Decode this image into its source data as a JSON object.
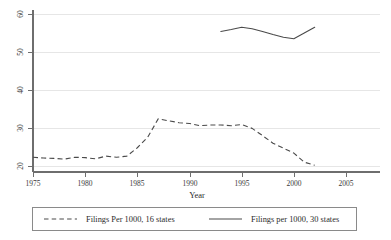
{
  "chart_data": {
    "type": "line",
    "title": "",
    "xlabel": "Year",
    "ylabel": "",
    "xlim": [
      1975,
      2005
    ],
    "ylim": [
      20,
      60
    ],
    "grid": true,
    "legend_position": "bottom",
    "x_ticks": [
      "1975",
      "1980",
      "1985",
      "1990",
      "1995",
      "2000",
      "2005"
    ],
    "x_tick_values": [
      1975,
      1980,
      1985,
      1990,
      1995,
      2000,
      2005
    ],
    "y_ticks": [
      "20",
      "30",
      "40",
      "50",
      "60"
    ],
    "y_tick_values": [
      20,
      30,
      40,
      50,
      60
    ],
    "series": [
      {
        "name": "Filings Per 1000, 16 states",
        "style": "dashed",
        "color": "#4a4a4a",
        "x": [
          1975,
          1976,
          1977,
          1978,
          1979,
          1980,
          1981,
          1982,
          1983,
          1984,
          1985,
          1986,
          1987,
          1988,
          1989,
          1990,
          1991,
          1992,
          1993,
          1994,
          1995,
          1996,
          1997,
          1998,
          1999,
          2000,
          2001,
          2002
        ],
        "values": [
          22.3,
          22.1,
          22.0,
          21.8,
          22.3,
          22.2,
          21.9,
          22.6,
          22.3,
          22.6,
          24.8,
          27.6,
          32.4,
          31.9,
          31.4,
          31.2,
          30.6,
          30.8,
          30.8,
          30.6,
          30.9,
          29.9,
          28.0,
          26.0,
          24.7,
          23.4,
          21.0,
          20.2
        ]
      },
      {
        "name": "Filings per 1000, 30 states",
        "style": "solid",
        "color": "#4a4a4a",
        "x": [
          1993,
          1994,
          1995,
          1996,
          1997,
          1998,
          1999,
          2000,
          2001,
          2002
        ],
        "values": [
          55.4,
          55.9,
          56.5,
          56.1,
          55.4,
          54.6,
          53.9,
          53.5,
          55.0,
          56.5
        ]
      }
    ]
  },
  "legend": {
    "entries": [
      {
        "label": "Filings Per 1000, 16 states",
        "swatch": "dashed-line-swatch"
      },
      {
        "label": "Filings per 1000, 30 states",
        "swatch": "solid-line-swatch"
      }
    ]
  },
  "axis": {
    "x_title": "Year"
  }
}
